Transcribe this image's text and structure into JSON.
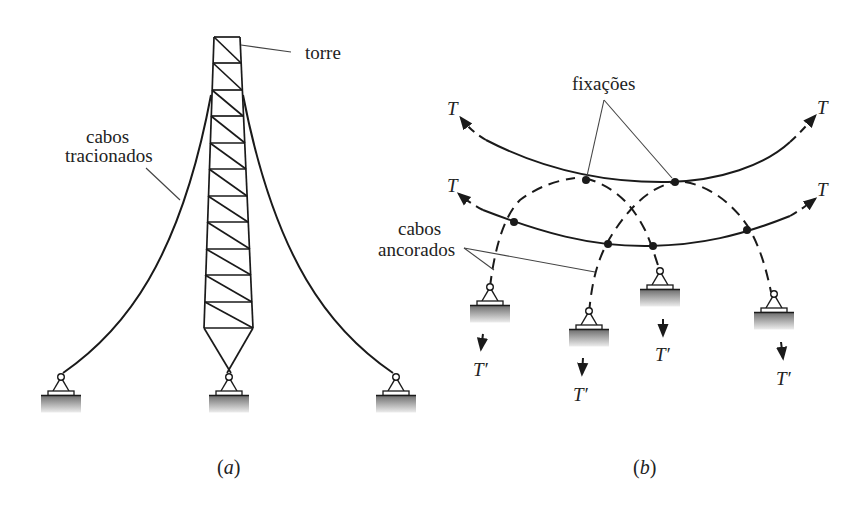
{
  "figure_a": {
    "caption": "(a)",
    "labels": {
      "tower": "torre",
      "cables_line1": "cabos",
      "cables_line2": "tracionados"
    },
    "tower_panels": 11,
    "supports": 3
  },
  "figure_b": {
    "caption": "(b)",
    "labels": {
      "fixings": "fixações",
      "anchored_line1": "cabos",
      "anchored_line2": "ancorados"
    },
    "tension_labels": {
      "top_left": "T",
      "top_right": "T",
      "mid_left": "T",
      "mid_right": "T",
      "anchor_1": "T′",
      "anchor_2": "T′",
      "anchor_3": "T′",
      "anchor_4": "T′"
    },
    "supports": 4
  },
  "colors": {
    "line": "#1a1a1a",
    "leader": "#444444",
    "ground_top": "#6e6e6e",
    "ground_bottom": "#e8e8e8"
  }
}
